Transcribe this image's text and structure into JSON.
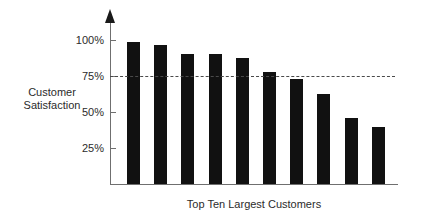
{
  "chart_data": {
    "type": "bar",
    "title": "",
    "subtitle": "",
    "xlabel": "Top Ten Largest Customers",
    "ylabel": "Customer\nSatisfaction",
    "categories": [
      "1",
      "2",
      "3",
      "4",
      "5",
      "6",
      "7",
      "8",
      "9",
      "10"
    ],
    "values": [
      95,
      93,
      87,
      87,
      84,
      75,
      70,
      60,
      44,
      38
    ],
    "value_unit": "%",
    "ylim": [
      0,
      108
    ],
    "ytick_values": [
      25,
      50,
      75,
      100
    ],
    "ytick_labels": [
      "25%",
      "50%",
      "75%",
      "100%"
    ],
    "xtick_labels": [],
    "grid": false,
    "legend": null,
    "legend_position": "none",
    "annotations": [
      {
        "name": "threshold-line",
        "kind": "horizontal-dashed-reference-line",
        "value": 75,
        "label": ""
      }
    ],
    "bar_color": "#111111",
    "axis_color": "#6f6f6f",
    "text_color": "#2b2b2b",
    "dash_color": "#4a4a4a",
    "background": "#ffffff"
  }
}
